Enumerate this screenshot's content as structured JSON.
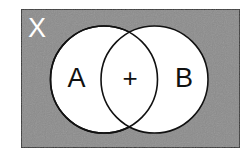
{
  "diagram": {
    "type": "venn",
    "universe": {
      "label": "X",
      "fill": "#8c8c8c",
      "stroke": "#1a1a1a",
      "label_color": "#ffffff"
    },
    "sets": [
      {
        "id": "A",
        "label": "A",
        "fill": "#ffffff",
        "stroke": "#111111"
      },
      {
        "id": "B",
        "label": "B",
        "fill": "#ffffff",
        "stroke": "#111111"
      }
    ],
    "intersection": {
      "label": "+"
    }
  }
}
